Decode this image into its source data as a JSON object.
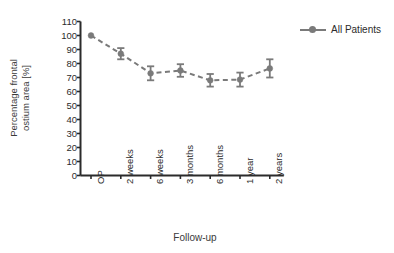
{
  "chart_data": {
    "type": "line",
    "title": "",
    "xlabel": "Follow-up",
    "ylabel": "Percentage frontal ostium area [%]",
    "ylabel_line1": "Percentage frontal",
    "ylabel_line2": "ostium area [%]",
    "categories": [
      "OP",
      "2 weeks",
      "6 weeks",
      "3 months",
      "6 months",
      "1 year",
      "2 years"
    ],
    "ylim": [
      0,
      110
    ],
    "ytick_values": [
      0,
      10,
      20,
      30,
      40,
      50,
      60,
      70,
      80,
      90,
      100,
      110
    ],
    "ytick_labels": [
      "0",
      "10",
      "20",
      "30",
      "40",
      "50",
      "60",
      "70",
      "80",
      "90",
      "100",
      "110"
    ],
    "grid": false,
    "legend_position": "right-top",
    "line_style": "dashed",
    "marker": "circle",
    "error_bars": "symmetric",
    "series": [
      {
        "name": "All Patients",
        "color": "#7a7a7a",
        "values": [
          100,
          87,
          73,
          75,
          68,
          68.5,
          76.5
        ],
        "errors": [
          0,
          4,
          5,
          4.5,
          4.5,
          5,
          6.5
        ]
      }
    ]
  },
  "legend": {
    "entries": [
      {
        "label": "All Patients"
      }
    ]
  },
  "axes": {
    "x_title": "Follow-up",
    "y_title_line1": "Percentage frontal",
    "y_title_line2": "ostium area [%]"
  }
}
